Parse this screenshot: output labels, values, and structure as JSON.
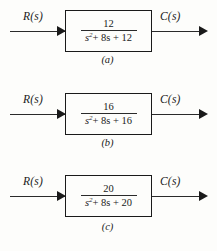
{
  "figure": {
    "background_color": "#fdfdfb",
    "line_color": "#1a1a1a",
    "blocks": [
      {
        "input_label": "R(s)",
        "output_label": "C(s)",
        "numerator": "12",
        "denominator_var": "s",
        "denominator_power": "2",
        "denominator_rest": "+ 8s + 12",
        "caption": "(a)"
      },
      {
        "input_label": "R(s)",
        "output_label": "C(s)",
        "numerator": "16",
        "denominator_var": "s",
        "denominator_power": "2",
        "denominator_rest": "+ 8s + 16",
        "caption": "(b)"
      },
      {
        "input_label": "R(s)",
        "output_label": "C(s)",
        "numerator": "20",
        "denominator_var": "s",
        "denominator_power": "2",
        "denominator_rest": "+ 8s + 20",
        "caption": "(c)"
      }
    ]
  }
}
